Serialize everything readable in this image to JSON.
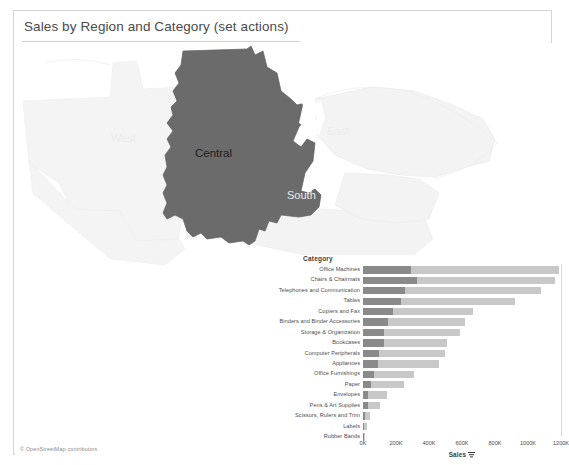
{
  "dashboard": {
    "title": "Sales by Region and Category (set actions)",
    "background_color": "#ffffff",
    "border_color": "#d4d4d4"
  },
  "map": {
    "name": "region-map",
    "attribution": "© OpenStreetMap contributors",
    "selected_region": "Central",
    "selected_color": "#6b6b6b",
    "unselected_color": "#f2f2f2",
    "regions": [
      {
        "label": "West",
        "selected": false
      },
      {
        "label": "Central",
        "selected": true
      },
      {
        "label": "East",
        "selected": false
      },
      {
        "label": "South",
        "selected": false
      }
    ]
  },
  "bar_chart": {
    "category_header": "Category",
    "axis_title": "Sales",
    "sort_icon": "sort-descending-icon",
    "selected_color": "#8a8a8a",
    "total_color": "#c8c8c8"
  },
  "chart_data": {
    "type": "bar",
    "title": "Sales by Region and Category (set actions)",
    "xlabel": "Sales",
    "ylabel": "Category",
    "xlim": [
      0,
      1200000
    ],
    "grid": false,
    "legend": "none",
    "orientation": "horizontal",
    "tick_labels": [
      "0K",
      "200K",
      "400K",
      "600K",
      "800K",
      "1000K",
      "1200K"
    ],
    "tick_values": [
      0,
      200000,
      400000,
      600000,
      800000,
      1000000,
      1200000
    ],
    "categories": [
      "Office Machines",
      "Chairs & Chairmats",
      "Telephones and Communication",
      "Tables",
      "Copiers and Fax",
      "Binders and Binder Accessories",
      "Storage & Organization",
      "Bookcases",
      "Computer Peripherals",
      "Appliances",
      "Office Furnishings",
      "Paper",
      "Envelopes",
      "Pens & Art Supplies",
      "Scissors, Rulers and Trim",
      "Labels",
      "Rubber Bands"
    ],
    "series": [
      {
        "name": "Central (selected)",
        "color": "#8a8a8a",
        "values": [
          290000,
          330000,
          255000,
          230000,
          180000,
          150000,
          130000,
          125000,
          95000,
          92000,
          67000,
          50000,
          32000,
          32000,
          14000,
          8000,
          4000
        ]
      },
      {
        "name": "Total Sales",
        "color": "#c8c8c8",
        "values": [
          1190000,
          1165000,
          1080000,
          920000,
          665000,
          620000,
          590000,
          510000,
          495000,
          460000,
          310000,
          250000,
          145000,
          105000,
          42000,
          24000,
          12000
        ]
      }
    ]
  }
}
